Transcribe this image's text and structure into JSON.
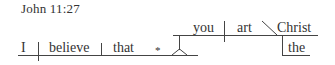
{
  "reference": "John 11:27",
  "diagram": {
    "main_clause": {
      "subject": "I",
      "verb": "believe",
      "direct_object_marker": "that",
      "implied_element": "*"
    },
    "object_clause": {
      "subject": "you",
      "verb": "art",
      "predicate_nominative": "Christ",
      "modifier": "the"
    }
  }
}
